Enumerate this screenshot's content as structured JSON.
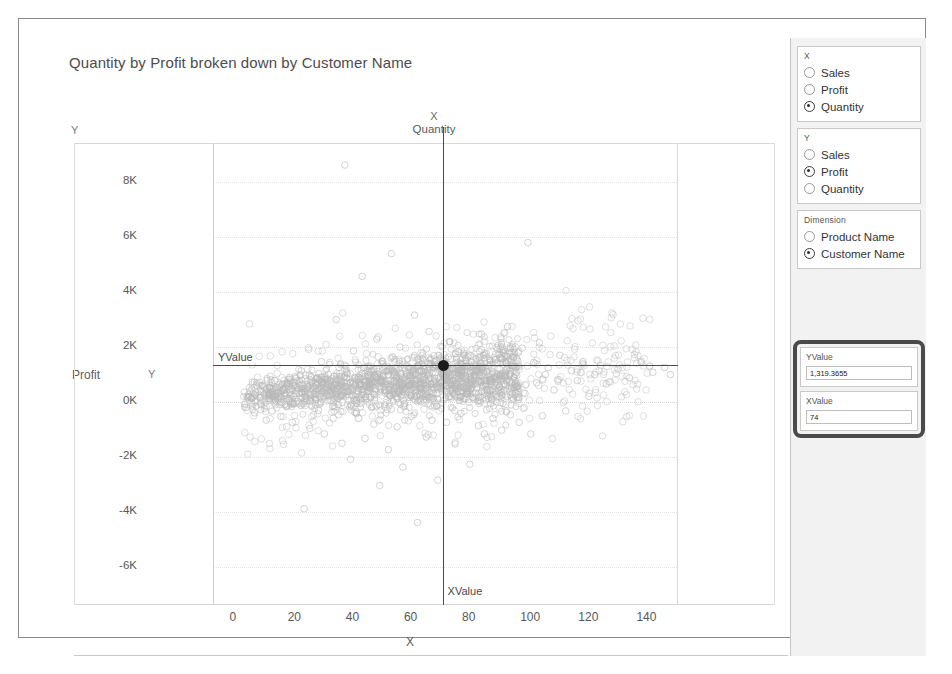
{
  "chart_data": {
    "type": "scatter",
    "title": "Quantity by Profit broken down by Customer Name",
    "xlabel": "X",
    "ylabel": "Y",
    "x_measure": "Quantity",
    "y_measure": "Profit",
    "dimension": "Customer Name",
    "xlim": [
      -5,
      155
    ],
    "ylim": [
      -7400,
      9400
    ],
    "xticks": [
      "0",
      "20",
      "40",
      "60",
      "80",
      "100",
      "120",
      "140"
    ],
    "xtick_values": [
      0,
      20,
      40,
      60,
      80,
      100,
      120,
      140
    ],
    "yticks": [
      "8K",
      "6K",
      "4K",
      "2K",
      "0K",
      "-2K",
      "-4K",
      "-6K"
    ],
    "ytick_values": [
      8000,
      6000,
      4000,
      2000,
      0,
      -2000,
      -4000,
      -6000
    ],
    "grid": true,
    "legend": "none",
    "marker": "open-circle",
    "marker_color": "#b8b8b8",
    "reference_lines": [
      {
        "name": "YValue",
        "orientation": "horizontal",
        "value": 1319.3655,
        "color": "#4a4a4a"
      },
      {
        "name": "XValue",
        "orientation": "vertical",
        "value": 74,
        "color": "#4a4a4a"
      }
    ],
    "highlight_point": {
      "x": 74,
      "y": 1319.3655,
      "color": "#1a1a1a"
    },
    "points": [
      [
        6,
        -220
      ],
      [
        8,
        120
      ],
      [
        9,
        -410
      ],
      [
        10,
        330
      ],
      [
        11,
        -90
      ],
      [
        12,
        540
      ],
      [
        13,
        -680
      ],
      [
        14,
        210
      ],
      [
        15,
        -350
      ],
      [
        16,
        760
      ],
      [
        17,
        60
      ],
      [
        18,
        -540
      ],
      [
        19,
        430
      ],
      [
        20,
        -150
      ],
      [
        21,
        880
      ],
      [
        22,
        -760
      ],
      [
        23,
        290
      ],
      [
        24,
        -60
      ],
      [
        25,
        1120
      ],
      [
        26,
        -3900
      ],
      [
        27,
        470
      ],
      [
        28,
        -980
      ],
      [
        29,
        250
      ],
      [
        30,
        690
      ],
      [
        31,
        -320
      ],
      [
        32,
        1450
      ],
      [
        33,
        -1180
      ],
      [
        34,
        820
      ],
      [
        35,
        40
      ],
      [
        36,
        -610
      ],
      [
        37,
        2980
      ],
      [
        38,
        1240
      ],
      [
        39,
        -1520
      ],
      [
        40,
        8600
      ],
      [
        41,
        360
      ],
      [
        42,
        -2100
      ],
      [
        43,
        1840
      ],
      [
        44,
        -430
      ],
      [
        45,
        620
      ],
      [
        46,
        4550
      ],
      [
        47,
        -1340
      ],
      [
        48,
        980
      ],
      [
        49,
        150
      ],
      [
        50,
        -820
      ],
      [
        51,
        2270
      ],
      [
        52,
        -3050
      ],
      [
        53,
        1460
      ],
      [
        54,
        310
      ],
      [
        55,
        -1750
      ],
      [
        56,
        5380
      ],
      [
        57,
        740
      ],
      [
        58,
        -920
      ],
      [
        59,
        1980
      ],
      [
        60,
        -2380
      ],
      [
        61,
        420
      ],
      [
        62,
        1170
      ],
      [
        63,
        -540
      ],
      [
        64,
        3140
      ],
      [
        65,
        -4400
      ],
      [
        66,
        860
      ],
      [
        67,
        230
      ],
      [
        68,
        -1290
      ],
      [
        69,
        2540
      ],
      [
        70,
        -680
      ],
      [
        71,
        1340
      ],
      [
        72,
        -2860
      ],
      [
        73,
        510
      ],
      [
        74,
        1319
      ],
      [
        75,
        -760
      ],
      [
        76,
        2180
      ],
      [
        77,
        390
      ],
      [
        78,
        -1540
      ],
      [
        79,
        930
      ],
      [
        80,
        -430
      ],
      [
        81,
        1760
      ],
      [
        82,
        270
      ],
      [
        83,
        -2280
      ],
      [
        84,
        1140
      ],
      [
        85,
        640
      ],
      [
        86,
        -880
      ],
      [
        87,
        2450
      ],
      [
        88,
        -1180
      ],
      [
        89,
        760
      ],
      [
        90,
        380
      ],
      [
        91,
        -620
      ],
      [
        92,
        1520
      ],
      [
        93,
        180
      ],
      [
        94,
        -1040
      ],
      [
        95,
        890
      ],
      [
        96,
        2720
      ],
      [
        97,
        -480
      ],
      [
        98,
        1310
      ],
      [
        99,
        540
      ],
      [
        100,
        -760
      ],
      [
        101,
        1940
      ],
      [
        102,
        290
      ],
      [
        103,
        5780
      ],
      [
        104,
        -1180
      ],
      [
        105,
        1420
      ],
      [
        106,
        680
      ],
      [
        107,
        2140
      ],
      [
        108,
        -520
      ],
      [
        109,
        980
      ],
      [
        110,
        1230
      ],
      [
        112,
        420
      ],
      [
        114,
        1680
      ],
      [
        116,
        -340
      ],
      [
        118,
        1120
      ],
      [
        120,
        760
      ],
      [
        122,
        1450
      ],
      [
        124,
        190
      ],
      [
        126,
        980
      ],
      [
        128,
        1310
      ],
      [
        130,
        640
      ],
      [
        134,
        1180
      ],
      [
        138,
        860
      ],
      [
        142,
        1420
      ],
      [
        146,
        1060
      ],
      [
        150,
        1240
      ],
      [
        152,
        980
      ]
    ]
  },
  "panel": {
    "x_group": {
      "title": "X",
      "options": [
        "Sales",
        "Profit",
        "Quantity"
      ],
      "selected": "Quantity"
    },
    "y_group": {
      "title": "Y",
      "options": [
        "Sales",
        "Profit",
        "Quantity"
      ],
      "selected": "Profit"
    },
    "dimension_group": {
      "title": "Dimension",
      "options": [
        "Product Name",
        "Customer Name"
      ],
      "selected": "Customer Name"
    },
    "value_group": {
      "highlight_color": "#4a4a4a",
      "fields": [
        {
          "label": "YValue",
          "value": "1,319.3655"
        },
        {
          "label": "XValue",
          "value": "74"
        }
      ]
    }
  },
  "labels": {
    "corner_y": "Y",
    "left_measure": "Profit",
    "left_y_glyph": "Y",
    "top_axis_letter": "X",
    "top_axis_measure": "Quantity",
    "bottom_axis_letter": "X",
    "ref_label_y": "YValue",
    "ref_label_x": "XValue"
  }
}
